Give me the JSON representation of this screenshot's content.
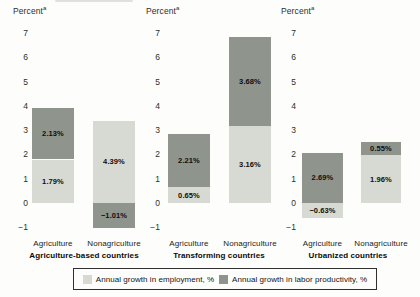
{
  "colors": {
    "background": "#fdfdfb",
    "employment_fill": "#d7dad2",
    "productivity_fill": "#8f948d",
    "axis_text": "#2e2e2c",
    "value_text": "#0e0e0e",
    "legend_border": "#2f2f2f"
  },
  "legend": {
    "items": [
      {
        "series": "employment",
        "label": "Annual growth in employment, %"
      },
      {
        "series": "productivity",
        "label": "Annual growth in labor productivity, %"
      }
    ]
  },
  "chart_data": {
    "type": "bar",
    "subtype": "stacked-decomposition",
    "ylim": [
      -1,
      7
    ],
    "yticks": [
      7,
      6,
      5,
      4,
      3,
      2,
      1,
      0,
      -1
    ],
    "grid": false,
    "legend_position": "bottom-boxed",
    "series_names": [
      "Annual growth in employment, %",
      "Annual growth in labor productivity, %"
    ],
    "panels": [
      {
        "caption": "Agriculture-based countries",
        "axis_label": "Percent",
        "axis_footnote": "a",
        "bars": [
          {
            "category": "Agriculture",
            "employment": 1.79,
            "productivity": 2.13,
            "segments": [
              {
                "series": "employment",
                "label": "1.79%",
                "from": 0,
                "to": 1.79
              },
              {
                "series": "productivity",
                "label": "2.13%",
                "from": 1.79,
                "to": 3.92
              }
            ]
          },
          {
            "category": "Nonagriculture",
            "employment": 4.39,
            "productivity": -1.01,
            "segments": [
              {
                "series": "productivity",
                "label": "−1.01%",
                "from": -1.01,
                "to": 0
              },
              {
                "series": "employment",
                "label": "4.39%",
                "from": 0,
                "to": 3.38
              }
            ]
          }
        ]
      },
      {
        "caption": "Transforming countries",
        "axis_label": "Percent",
        "axis_footnote": "a",
        "bars": [
          {
            "category": "Agriculture",
            "employment": 0.65,
            "productivity": 2.21,
            "segments": [
              {
                "series": "employment",
                "label": "0.65%",
                "from": 0,
                "to": 0.65
              },
              {
                "series": "productivity",
                "label": "2.21%",
                "from": 0.65,
                "to": 2.86
              }
            ]
          },
          {
            "category": "Nonagriculture",
            "employment": 3.16,
            "productivity": 3.68,
            "segments": [
              {
                "series": "employment",
                "label": "3.16%",
                "from": 0,
                "to": 3.16
              },
              {
                "series": "productivity",
                "label": "3.68%",
                "from": 3.16,
                "to": 6.84
              }
            ]
          }
        ]
      },
      {
        "caption": "Urbanized countries",
        "axis_label": "Percent",
        "axis_footnote": "a",
        "bars": [
          {
            "category": "Agriculture",
            "employment": -0.63,
            "productivity": 2.69,
            "segments": [
              {
                "series": "employment",
                "label": "−0.63%",
                "from": -0.63,
                "to": 0
              },
              {
                "series": "productivity",
                "label": "2.69%",
                "from": 0,
                "to": 2.06
              }
            ]
          },
          {
            "category": "Nonagriculture",
            "employment": 1.96,
            "productivity": 0.55,
            "segments": [
              {
                "series": "employment",
                "label": "1.96%",
                "from": 0,
                "to": 1.96
              },
              {
                "series": "productivity",
                "label": "0.55%",
                "from": 1.96,
                "to": 2.51
              }
            ]
          }
        ]
      }
    ]
  }
}
